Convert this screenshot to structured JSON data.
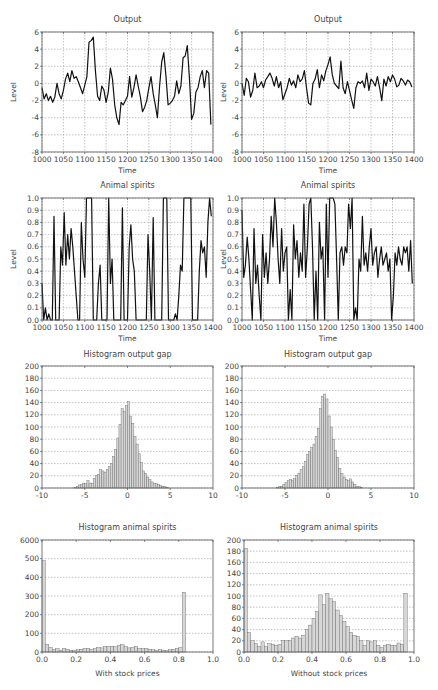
{
  "figure": {
    "panels": [
      {
        "id": "output-with",
        "title": "Output",
        "ylabel": "Level",
        "xlabel": "Time"
      },
      {
        "id": "output-without",
        "title": "Output",
        "ylabel": "Level",
        "xlabel": "Time"
      },
      {
        "id": "spirits-with",
        "title": "Animal spirits",
        "ylabel": "Level",
        "xlabel": "Time"
      },
      {
        "id": "spirits-without",
        "title": "Animal spirits",
        "ylabel": "Level",
        "xlabel": "Time"
      },
      {
        "id": "hist-gap-with",
        "title": "Histogram output gap",
        "ylabel": "",
        "xlabel": ""
      },
      {
        "id": "hist-gap-without",
        "title": "Histogram output gap",
        "ylabel": "",
        "xlabel": ""
      },
      {
        "id": "hist-spirits-with",
        "title": "Histogram animal spirits",
        "ylabel": "",
        "xlabel": "With stock prices"
      },
      {
        "id": "hist-spirits-without",
        "title": "Histogram animal spirits",
        "ylabel": "",
        "xlabel": "Without stock prices"
      }
    ]
  },
  "chart_data": [
    {
      "type": "line",
      "title": "Output",
      "xlabel": "Time",
      "ylabel": "Level",
      "xlim": [
        1000,
        1400
      ],
      "ylim": [
        -8,
        6
      ],
      "xticks": [
        1000,
        1050,
        1100,
        1150,
        1200,
        1250,
        1300,
        1350,
        1400
      ],
      "yticks": [
        -8,
        -6,
        -4,
        -2,
        0,
        2,
        4,
        6
      ],
      "grid": true,
      "x": [
        1000,
        1005,
        1010,
        1015,
        1020,
        1025,
        1030,
        1035,
        1040,
        1045,
        1050,
        1055,
        1060,
        1065,
        1070,
        1075,
        1080,
        1085,
        1090,
        1095,
        1100,
        1105,
        1110,
        1115,
        1120,
        1125,
        1130,
        1135,
        1140,
        1145,
        1150,
        1155,
        1160,
        1165,
        1170,
        1175,
        1180,
        1185,
        1190,
        1195,
        1200,
        1205,
        1210,
        1215,
        1220,
        1225,
        1230,
        1235,
        1240,
        1245,
        1250,
        1255,
        1260,
        1265,
        1270,
        1275,
        1280,
        1285,
        1290,
        1295,
        1300,
        1305,
        1310,
        1315,
        1320,
        1325,
        1330,
        1335,
        1340,
        1345,
        1350,
        1355,
        1360,
        1365,
        1370,
        1375,
        1380,
        1385,
        1390,
        1395
      ],
      "y": [
        -0.5,
        -1.8,
        -1.2,
        -2.0,
        -1.5,
        -2.2,
        -1.6,
        0.0,
        -1.2,
        -1.8,
        -0.8,
        0.5,
        1.2,
        0.2,
        1.5,
        0.6,
        0.8,
        0.2,
        -0.5,
        -1.2,
        -0.2,
        0.8,
        4.8,
        5.0,
        5.4,
        1.5,
        -1.5,
        -2.0,
        -0.3,
        -0.8,
        -2.2,
        -1.0,
        1.8,
        0.5,
        -2.5,
        -4.0,
        -4.8,
        -2.2,
        -2.5,
        -2.0,
        -1.5,
        0.8,
        -1.6,
        -0.5,
        1.0,
        -0.3,
        -1.5,
        -3.3,
        -2.8,
        -2.0,
        -0.5,
        0.8,
        -1.2,
        -2.5,
        -4.0,
        -0.3,
        2.5,
        3.6,
        0.8,
        -2.5,
        -2.3,
        -2.0,
        -1.5,
        0.3,
        -1.2,
        -0.3,
        3.0,
        3.2,
        4.4,
        0.5,
        -4.2,
        -3.5,
        -1.0,
        -0.5,
        0.8,
        1.5,
        -0.5,
        1.5,
        1.2,
        -4.8
      ]
    },
    {
      "type": "line",
      "title": "Output",
      "xlabel": "Time",
      "ylabel": "Level",
      "xlim": [
        1000,
        1400
      ],
      "ylim": [
        -8,
        6
      ],
      "xticks": [
        1000,
        1050,
        1100,
        1150,
        1200,
        1250,
        1300,
        1350,
        1400
      ],
      "yticks": [
        -8,
        -6,
        -4,
        -2,
        0,
        2,
        4,
        6
      ],
      "grid": true,
      "x": [
        1000,
        1005,
        1010,
        1015,
        1020,
        1025,
        1030,
        1035,
        1040,
        1045,
        1050,
        1055,
        1060,
        1065,
        1070,
        1075,
        1080,
        1085,
        1090,
        1095,
        1100,
        1105,
        1110,
        1115,
        1120,
        1125,
        1130,
        1135,
        1140,
        1145,
        1150,
        1155,
        1160,
        1165,
        1170,
        1175,
        1180,
        1185,
        1190,
        1195,
        1200,
        1205,
        1210,
        1215,
        1220,
        1225,
        1230,
        1235,
        1240,
        1245,
        1250,
        1255,
        1260,
        1265,
        1270,
        1275,
        1280,
        1285,
        1290,
        1295,
        1300,
        1305,
        1310,
        1315,
        1320,
        1325,
        1330,
        1335,
        1340,
        1345,
        1350,
        1355,
        1360,
        1365,
        1370,
        1375,
        1380,
        1385,
        1390,
        1395
      ],
      "y": [
        0.0,
        -1.4,
        0.6,
        0.2,
        -1.6,
        -0.8,
        1.2,
        -0.5,
        -0.3,
        0.2,
        -0.5,
        0.4,
        0.8,
        1.2,
        0.6,
        -0.3,
        0.8,
        -0.5,
        0.2,
        -1.9,
        -1.2,
        -0.5,
        0.6,
        -0.2,
        0.3,
        -0.5,
        1.0,
        0.2,
        0.5,
        1.5,
        -0.5,
        -2.3,
        -2.5,
        0.0,
        0.5,
        1.6,
        -0.5,
        1.0,
        0.3,
        1.5,
        2.2,
        3.1,
        1.0,
        0.0,
        -0.3,
        -0.6,
        2.6,
        -0.5,
        -1.2,
        0.2,
        -0.8,
        -1.9,
        -2.9,
        -0.5,
        0.2,
        0.0,
        0.3,
        -0.5,
        1.2,
        -0.8,
        0.5,
        0.2,
        -0.3,
        0.8,
        -0.5,
        -2.0,
        0.5,
        -0.3,
        0.8,
        0.2,
        1.0,
        0.5,
        -0.4,
        -0.2,
        0.6,
        0.3,
        -0.2,
        0.4,
        0.2,
        -0.4
      ]
    },
    {
      "type": "line",
      "title": "Animal spirits",
      "xlabel": "Time",
      "ylabel": "Level",
      "xlim": [
        1000,
        1400
      ],
      "ylim": [
        0.0,
        1.0
      ],
      "xticks": [
        1000,
        1050,
        1100,
        1150,
        1200,
        1250,
        1300,
        1350,
        1400
      ],
      "yticks": [
        0.0,
        0.1,
        0.2,
        0.3,
        0.4,
        0.5,
        0.6,
        0.7,
        0.8,
        0.9,
        1.0
      ],
      "grid": true,
      "x": [
        1000,
        1004,
        1008,
        1012,
        1016,
        1020,
        1024,
        1028,
        1032,
        1036,
        1040,
        1044,
        1048,
        1052,
        1056,
        1060,
        1064,
        1068,
        1072,
        1076,
        1080,
        1084,
        1088,
        1092,
        1096,
        1100,
        1104,
        1108,
        1112,
        1116,
        1120,
        1124,
        1128,
        1132,
        1136,
        1140,
        1144,
        1148,
        1152,
        1156,
        1160,
        1164,
        1168,
        1172,
        1176,
        1180,
        1184,
        1188,
        1192,
        1196,
        1200,
        1204,
        1208,
        1212,
        1216,
        1220,
        1224,
        1228,
        1232,
        1236,
        1240,
        1244,
        1248,
        1252,
        1256,
        1260,
        1264,
        1268,
        1272,
        1276,
        1280,
        1284,
        1288,
        1292,
        1296,
        1300,
        1304,
        1308,
        1312,
        1316,
        1320,
        1324,
        1328,
        1332,
        1336,
        1340,
        1344,
        1348,
        1352,
        1356,
        1360,
        1364,
        1368,
        1372,
        1376,
        1380,
        1384,
        1388,
        1392,
        1396
      ],
      "y": [
        0.3,
        0.0,
        0.1,
        0.0,
        0.05,
        0.0,
        0.0,
        0.85,
        0.0,
        0.0,
        0.0,
        0.6,
        0.45,
        0.88,
        0.45,
        0.7,
        0.5,
        0.75,
        0.6,
        0.4,
        0.2,
        0.0,
        0.0,
        0.8,
        0.5,
        0.35,
        1.0,
        1.0,
        1.0,
        1.0,
        0.0,
        0.0,
        0.0,
        0.3,
        0.45,
        0.0,
        0.0,
        0.0,
        0.0,
        1.0,
        0.3,
        0.5,
        0.0,
        0.0,
        0.0,
        0.0,
        0.0,
        0.92,
        0.0,
        0.0,
        0.0,
        0.6,
        0.78,
        0.5,
        0.4,
        0.0,
        0.0,
        0.0,
        0.0,
        0.0,
        0.0,
        0.0,
        0.7,
        0.4,
        0.0,
        0.84,
        0.0,
        0.0,
        0.0,
        0.0,
        0.0,
        1.0,
        1.0,
        1.0,
        0.0,
        0.0,
        0.0,
        0.0,
        0.05,
        0.0,
        0.2,
        0.45,
        0.4,
        1.0,
        1.0,
        1.0,
        1.0,
        1.0,
        0.0,
        0.0,
        0.0,
        0.0,
        0.4,
        0.65,
        0.55,
        0.6,
        0.35,
        0.8,
        1.0,
        0.85
      ]
    },
    {
      "type": "line",
      "title": "Animal spirits",
      "xlabel": "Time",
      "ylabel": "Level",
      "xlim": [
        1000,
        1400
      ],
      "ylim": [
        0.0,
        1.0
      ],
      "xticks": [
        1000,
        1050,
        1100,
        1150,
        1200,
        1250,
        1300,
        1350,
        1400
      ],
      "yticks": [
        0.0,
        0.1,
        0.2,
        0.3,
        0.4,
        0.5,
        0.6,
        0.7,
        0.8,
        0.9,
        1.0
      ],
      "grid": true,
      "x": [
        1000,
        1004,
        1008,
        1012,
        1016,
        1020,
        1024,
        1028,
        1032,
        1036,
        1040,
        1044,
        1048,
        1052,
        1056,
        1060,
        1064,
        1068,
        1072,
        1076,
        1080,
        1084,
        1088,
        1092,
        1096,
        1100,
        1104,
        1108,
        1112,
        1116,
        1120,
        1124,
        1128,
        1132,
        1136,
        1140,
        1144,
        1148,
        1152,
        1156,
        1160,
        1164,
        1168,
        1172,
        1176,
        1180,
        1184,
        1188,
        1192,
        1196,
        1200,
        1204,
        1208,
        1212,
        1216,
        1220,
        1224,
        1228,
        1232,
        1236,
        1240,
        1244,
        1248,
        1252,
        1256,
        1260,
        1264,
        1268,
        1272,
        1276,
        1280,
        1284,
        1288,
        1292,
        1296,
        1300,
        1304,
        1308,
        1312,
        1316,
        1320,
        1324,
        1328,
        1332,
        1336,
        1340,
        1344,
        1348,
        1352,
        1356,
        1360,
        1364,
        1368,
        1372,
        1376,
        1380,
        1384,
        1388,
        1392,
        1396
      ],
      "y": [
        0.9,
        0.35,
        0.45,
        0.68,
        0.5,
        0.25,
        0.0,
        0.75,
        0.3,
        0.45,
        0.2,
        0.0,
        0.7,
        0.35,
        0.55,
        0.3,
        0.5,
        0.85,
        0.6,
        1.0,
        0.8,
        0.5,
        0.3,
        0.75,
        0.4,
        0.55,
        0.6,
        0.0,
        0.25,
        0.0,
        0.78,
        0.5,
        0.65,
        0.35,
        0.55,
        0.4,
        0.95,
        0.35,
        0.6,
        0.95,
        1.0,
        0.6,
        0.0,
        0.4,
        0.0,
        0.8,
        0.5,
        0.6,
        0.0,
        0.95,
        0.35,
        1.0,
        1.0,
        1.0,
        0.95,
        0.5,
        0.0,
        0.55,
        0.6,
        0.45,
        0.6,
        0.55,
        0.95,
        0.75,
        1.0,
        0.0,
        0.1,
        0.0,
        0.5,
        0.4,
        0.85,
        0.45,
        0.55,
        0.4,
        0.6,
        0.75,
        0.45,
        0.55,
        0.6,
        0.35,
        0.5,
        0.6,
        0.45,
        0.5,
        0.55,
        0.4,
        0.5,
        0.0,
        0.2,
        0.55,
        0.45,
        0.6,
        0.5,
        0.45,
        0.6,
        0.55,
        0.6,
        0.4,
        0.65,
        0.3
      ]
    },
    {
      "type": "bar",
      "title": "Histogram output gap",
      "xlabel": "",
      "ylabel": "",
      "xlim": [
        -10,
        10
      ],
      "ylim": [
        0,
        200
      ],
      "xticks": [
        -10,
        -5,
        0,
        5,
        10
      ],
      "yticks": [
        0,
        20,
        40,
        60,
        80,
        100,
        120,
        140,
        160,
        180,
        200
      ],
      "grid": true,
      "bin_start": -6.25,
      "bin_width": 0.25,
      "values": [
        1,
        3,
        5,
        6,
        8,
        7,
        12,
        8,
        8,
        16,
        20,
        22,
        30,
        28,
        26,
        30,
        35,
        40,
        52,
        63,
        82,
        104,
        130,
        125,
        135,
        142,
        118,
        106,
        84,
        72,
        56,
        42,
        28,
        24,
        18,
        14,
        10,
        8,
        7,
        6,
        4,
        3,
        2,
        1
      ]
    },
    {
      "type": "bar",
      "title": "Histogram output gap",
      "xlabel": "",
      "ylabel": "",
      "xlim": [
        -10,
        10
      ],
      "ylim": [
        0,
        200
      ],
      "xticks": [
        -10,
        -5,
        0,
        5,
        10
      ],
      "yticks": [
        0,
        20,
        40,
        60,
        80,
        100,
        120,
        140,
        160,
        180,
        200
      ],
      "grid": true,
      "bin_start": -6.0,
      "bin_width": 0.25,
      "values": [
        1,
        2,
        3,
        6,
        9,
        12,
        14,
        13,
        16,
        20,
        24,
        30,
        35,
        44,
        55,
        60,
        66,
        72,
        84,
        98,
        130,
        150,
        154,
        146,
        118,
        100,
        80,
        62,
        50,
        32,
        24,
        18,
        14,
        12,
        15,
        10,
        6,
        3,
        2,
        1
      ]
    },
    {
      "type": "bar",
      "title": "Histogram animal spirits",
      "xlabel": "With stock prices",
      "ylabel": "",
      "xlim": [
        0.0,
        1.0
      ],
      "ylim": [
        0,
        600
      ],
      "xticks": [
        0.0,
        0.2,
        0.4,
        0.6,
        0.8,
        1.0
      ],
      "yticks": [
        0,
        100,
        200,
        300,
        400,
        500,
        600
      ],
      "ytick_labels": [
        "0",
        "100",
        "200",
        "300",
        "400",
        "500",
        "6000"
      ],
      "grid": true,
      "bin_start": 0.0,
      "bin_width": 0.02,
      "values": [
        490,
        40,
        25,
        15,
        18,
        10,
        20,
        15,
        8,
        10,
        12,
        15,
        18,
        20,
        15,
        18,
        25,
        22,
        30,
        28,
        30,
        28,
        35,
        40,
        30,
        22,
        25,
        30,
        20,
        18,
        20,
        15,
        12,
        10,
        12,
        10,
        8,
        12,
        15,
        20,
        25,
        320
      ]
    },
    {
      "type": "bar",
      "title": "Histogram animal spirits",
      "xlabel": "Without stock prices",
      "ylabel": "",
      "xlim": [
        0.0,
        1.0
      ],
      "ylim": [
        0,
        200
      ],
      "xticks": [
        0.0,
        0.2,
        0.4,
        0.6,
        0.8,
        1.0
      ],
      "yticks": [
        0,
        20,
        40,
        60,
        80,
        100,
        120,
        140,
        160,
        180,
        200
      ],
      "grid": true,
      "bin_start": 0.0,
      "bin_width": 0.02,
      "values": [
        185,
        35,
        20,
        15,
        10,
        18,
        10,
        15,
        14,
        12,
        14,
        20,
        20,
        20,
        25,
        28,
        25,
        30,
        40,
        48,
        60,
        72,
        102,
        85,
        105,
        95,
        90,
        75,
        65,
        55,
        45,
        35,
        30,
        28,
        20,
        12,
        20,
        18,
        20,
        12,
        8,
        12,
        14,
        12,
        12,
        16,
        14,
        105
      ]
    }
  ]
}
